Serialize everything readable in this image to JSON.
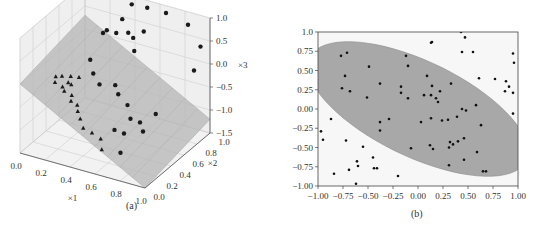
{
  "chart_data": [
    {
      "id": "a",
      "type": "scatter3d",
      "caption": "(a)",
      "xlabel": "×1",
      "ylabel": "×2",
      "zlabel": "×3",
      "x_ticks": [
        "0.0",
        "0.2",
        "0.4",
        "0.6",
        "0.8",
        "1.0"
      ],
      "y_ticks": [
        "0.0",
        "0.2",
        "0.4",
        "0.6",
        "0.8",
        "1.0"
      ],
      "z_ticks": [
        "1.0",
        "0.5",
        "0.0",
        "−0.5",
        "−1.0",
        "−1.5"
      ],
      "xlim": [
        0,
        1
      ],
      "ylim": [
        0,
        1
      ],
      "zlim": [
        -1.5,
        1.0
      ],
      "series": [
        {
          "name": "class circles",
          "marker": "circle",
          "color": "#1a1a1a"
        },
        {
          "name": "class triangles",
          "marker": "triangle",
          "color": "#1a1a1a"
        },
        {
          "name": "decision plane",
          "type": "surface",
          "color": "#b5b5b5"
        }
      ],
      "grid": true
    },
    {
      "id": "b",
      "type": "scatter",
      "caption": "(b)",
      "xlabel": "",
      "ylabel": "",
      "xlim": [
        -1,
        1
      ],
      "ylim": [
        -1,
        1
      ],
      "x_ticks": [
        "−1.00",
        "−0.75",
        "−0.50",
        "−0.25",
        "0.00",
        "0.25",
        "0.50",
        "0.75",
        "1.00"
      ],
      "y_ticks": [
        "1.0",
        "0.75",
        "0.50",
        "0.25",
        "0.00",
        "−0.25",
        "−0.50",
        "−0.75",
        "−1.00"
      ],
      "region": {
        "shape": "ellipse",
        "center": [
          0.0,
          0.0
        ],
        "angle_deg": -35,
        "semi_major": 1.28,
        "semi_minor": 0.58,
        "color": "#a8a8a8"
      },
      "points": [
        [
          -0.97,
          -0.29
        ],
        [
          -0.95,
          -0.4
        ],
        [
          -0.87,
          -0.13
        ],
        [
          -0.84,
          -0.84
        ],
        [
          -0.77,
          0.69
        ],
        [
          -0.76,
          0.27
        ],
        [
          -0.73,
          0.43
        ],
        [
          -0.71,
          0.73
        ],
        [
          -0.68,
          0.23
        ],
        [
          -0.72,
          -0.41
        ],
        [
          -0.69,
          -0.79
        ],
        [
          -0.61,
          -0.68
        ],
        [
          -0.6,
          -0.74
        ],
        [
          -0.62,
          -0.97
        ],
        [
          -0.55,
          -0.49
        ],
        [
          -0.49,
          0.55
        ],
        [
          -0.51,
          0.15
        ],
        [
          -0.45,
          -0.63
        ],
        [
          -0.44,
          -0.77
        ],
        [
          -0.41,
          -0.77
        ],
        [
          -0.38,
          0.33
        ],
        [
          -0.38,
          -0.17
        ],
        [
          -0.38,
          -0.28
        ],
        [
          -0.29,
          -0.13
        ],
        [
          -0.2,
          -0.87
        ],
        [
          -0.17,
          0.29
        ],
        [
          -0.17,
          0.21
        ],
        [
          -0.12,
          0.69
        ],
        [
          -0.1,
          0.56
        ],
        [
          -0.1,
          0.14
        ],
        [
          -0.07,
          -0.51
        ],
        [
          0.03,
          -0.17
        ],
        [
          0.06,
          0.18
        ],
        [
          0.09,
          0.43
        ],
        [
          0.13,
          0.86
        ],
        [
          0.14,
          0.87
        ],
        [
          0.13,
          0.18
        ],
        [
          0.14,
          0.3
        ],
        [
          0.13,
          -0.12
        ],
        [
          0.12,
          -0.47
        ],
        [
          0.15,
          -0.52
        ],
        [
          0.18,
          0.14
        ],
        [
          0.2,
          0.09
        ],
        [
          0.22,
          0.23
        ],
        [
          0.24,
          -0.15
        ],
        [
          0.3,
          -0.14
        ],
        [
          0.31,
          -0.5
        ],
        [
          0.31,
          -0.73
        ],
        [
          0.32,
          -0.43
        ],
        [
          0.33,
          0.33
        ],
        [
          0.35,
          -0.46
        ],
        [
          0.39,
          -0.1
        ],
        [
          0.4,
          -0.42
        ],
        [
          0.43,
          1.0
        ],
        [
          0.44,
          0.74
        ],
        [
          0.44,
          0.0
        ],
        [
          0.46,
          -0.38
        ],
        [
          0.46,
          -0.66
        ],
        [
          0.47,
          0.93
        ],
        [
          0.48,
          -0.02
        ],
        [
          0.55,
          0.74
        ],
        [
          0.58,
          0.05
        ],
        [
          0.59,
          -0.56
        ],
        [
          0.61,
          0.4
        ],
        [
          0.63,
          -0.21
        ],
        [
          0.65,
          -0.81
        ],
        [
          0.68,
          -0.81
        ],
        [
          0.77,
          0.39
        ],
        [
          0.87,
          0.23
        ],
        [
          0.88,
          0.36
        ],
        [
          0.91,
          0.29
        ],
        [
          0.95,
          0.72
        ],
        [
          0.96,
          0.6
        ],
        [
          0.95,
          0.21
        ],
        [
          0.95,
          -0.06
        ]
      ],
      "grid": false
    }
  ]
}
